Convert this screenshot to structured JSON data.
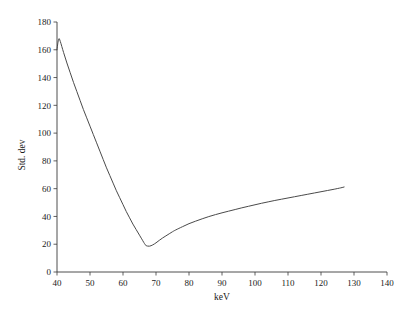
{
  "chart_data": {
    "type": "line",
    "title": "",
    "subtitle": "",
    "xlabel": "keV",
    "ylabel": "Std. dev",
    "xlim": [
      40,
      140
    ],
    "ylim": [
      0,
      180
    ],
    "grid": false,
    "legend": false,
    "legend_position": "none",
    "xticks": [
      40,
      50,
      60,
      70,
      80,
      90,
      100,
      110,
      120,
      130,
      140
    ],
    "yticks": [
      0,
      20,
      40,
      60,
      80,
      100,
      120,
      140,
      160,
      180
    ],
    "xtick_labels": [
      "40",
      "50",
      "60",
      "70",
      "80",
      "90",
      "100",
      "110",
      "120",
      "130",
      "140"
    ],
    "ytick_labels": [
      "0",
      "20",
      "40",
      "60",
      "80",
      "100",
      "120",
      "140",
      "160",
      "180"
    ],
    "line_color": "#4a4a4a",
    "axis_color": "#3a3a3a",
    "background_color": "#ffffff",
    "annotations": [],
    "series": [
      {
        "name": "Std. dev",
        "x": [
          40.0,
          40.3,
          40.6,
          41.0,
          42.0,
          43.0,
          44.0,
          45.0,
          46.0,
          47.0,
          48.0,
          49.0,
          50.0,
          51.0,
          52.0,
          53.0,
          54.0,
          55.0,
          56.0,
          57.0,
          58.0,
          59.0,
          60.0,
          61.0,
          62.0,
          63.0,
          64.0,
          65.0,
          66.0,
          66.5,
          67.0,
          68.0,
          69.0,
          70.0,
          71.0,
          72.0,
          73.0,
          74.0,
          75.0,
          76.0,
          78.0,
          80.0,
          82.0,
          84.0,
          86.0,
          88.0,
          90.0,
          92.0,
          94.0,
          96.0,
          98.0,
          100.0,
          102.0,
          104.0,
          106.0,
          108.0,
          110.0,
          112.0,
          114.0,
          116.0,
          118.0,
          120.0,
          122.0,
          124.0,
          126.0,
          127.0
        ],
        "y": [
          160.0,
          165.5,
          168.0,
          166.0,
          158.0,
          150.5,
          143.5,
          136.5,
          130.0,
          123.5,
          117.0,
          111.0,
          105.0,
          99.0,
          93.0,
          87.0,
          81.0,
          75.0,
          69.5,
          64.0,
          58.5,
          53.5,
          48.5,
          43.5,
          39.0,
          34.5,
          30.5,
          26.5,
          22.5,
          20.5,
          19.0,
          18.6,
          19.5,
          21.0,
          22.8,
          24.5,
          26.0,
          27.5,
          29.0,
          30.3,
          32.6,
          34.8,
          36.6,
          38.3,
          39.9,
          41.3,
          42.6,
          43.8,
          45.0,
          46.2,
          47.3,
          48.4,
          49.5,
          50.5,
          51.5,
          52.4,
          53.3,
          54.2,
          55.1,
          56.0,
          56.9,
          57.8,
          58.7,
          59.6,
          60.6,
          61.2
        ]
      }
    ]
  },
  "axis_titles": {
    "x": "keV",
    "y": "Std. dev"
  }
}
